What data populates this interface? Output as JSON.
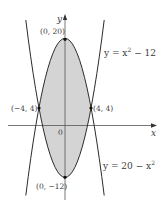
{
  "figure": {
    "axes": {
      "x_label": "x",
      "y_label": "y",
      "origin_label": "0"
    },
    "curves": [
      {
        "id": "upper-bound",
        "equation": "y = 20 − x",
        "label_text": "y = 20 − x",
        "exponent": "2"
      },
      {
        "id": "lower-bound",
        "equation": "y = x − 12",
        "label_prefix": "y = x",
        "exponent": "2",
        "label_suffix": " − 12"
      }
    ],
    "points": [
      {
        "label": "(0, 20)",
        "x": 0,
        "y": 20
      },
      {
        "label": "(−4, 4)",
        "x": -4,
        "y": 4
      },
      {
        "label": "(4, 4)",
        "x": 4,
        "y": 4
      },
      {
        "label": "(0, −12)",
        "x": 0,
        "y": -12
      }
    ],
    "shaded_region": "area between y = 20 − x² and y = x² − 12 for −4 ≤ x ≤ 4",
    "colors": {
      "fill": "#d4d4d4",
      "stroke": "#2b2b2b",
      "axis": "#555555"
    }
  }
}
